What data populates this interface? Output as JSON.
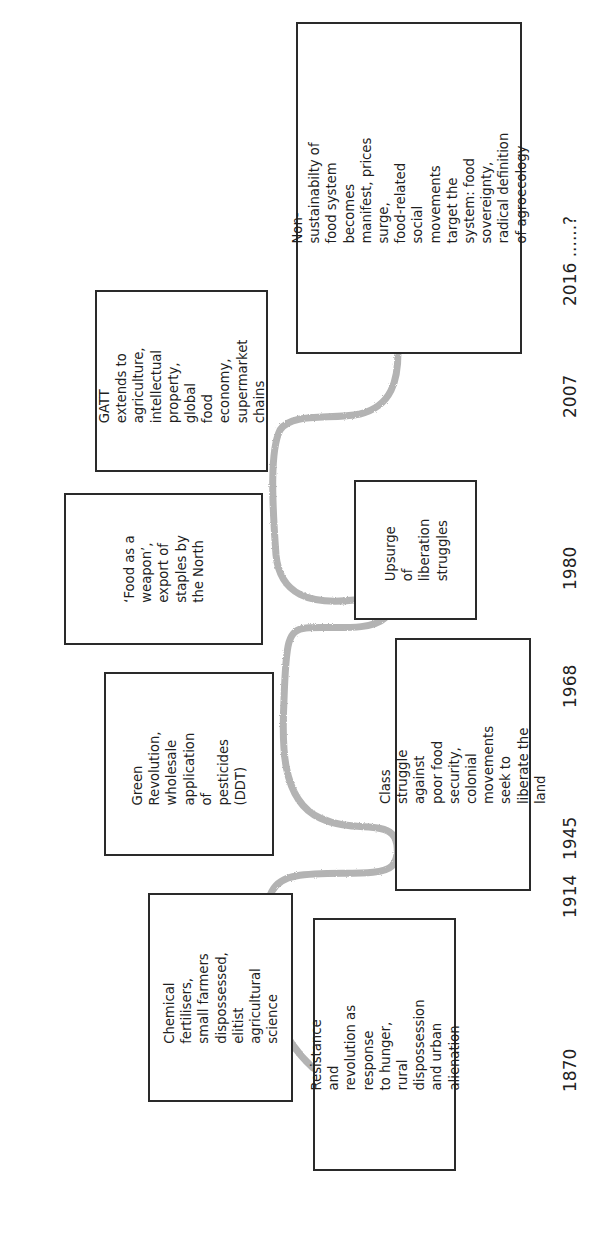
{
  "diagram": {
    "type": "timeline",
    "orientation": "rotated-90-ccw",
    "line_color": "#b3b3b3",
    "border_color": "#2a2a2a",
    "events": [
      {
        "id": "resistance",
        "text": "Resistance and\nrevolution as response\nto hunger, rural\ndispossession and urban\nalienation",
        "side": "below"
      },
      {
        "id": "chemical",
        "text": "Chemical fertilisers,\nsmall farmers\ndispossessed, elitist\nagricultural science",
        "side": "above"
      },
      {
        "id": "class-struggle",
        "text": "Class struggle against\npoor food security,\ncolonial movements\nseek to liberate the land",
        "side": "below"
      },
      {
        "id": "green-revolution",
        "text": "Green\nRevolution,\nwholesale\napplication of\npesticides (DDT)",
        "side": "above"
      },
      {
        "id": "upsurge",
        "text": "Upsurge of\nliberation\nstruggles",
        "side": "below"
      },
      {
        "id": "food-weapon",
        "text": "‘Food as a\nweapon’,\nexport of\nstaples by\nthe North",
        "side": "above"
      },
      {
        "id": "gatt",
        "text": "GATT extends to\nagriculture,\nintellectual\nproperty, global\nfood economy,\nsupermarket\nchains",
        "side": "above"
      },
      {
        "id": "non-sustainability",
        "text": "Non-sustainabilty of food system\nbecomes manifest, prices surge,\nfood-related social movements\ntarget the system: food\nsovereignty, radical definition\nof agroecology",
        "side": "below"
      }
    ],
    "years": [
      "1870",
      "1914",
      "1945",
      "1968",
      "1980",
      "2007",
      "2016 ......?"
    ]
  }
}
